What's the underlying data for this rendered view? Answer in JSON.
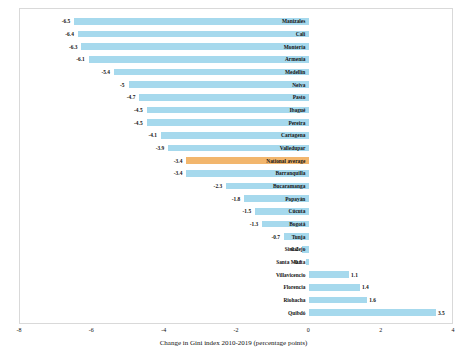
{
  "chart_data": {
    "type": "bar",
    "orientation": "horizontal",
    "title": "",
    "xlabel": "Change in Gini index 2010-2019 (percentage points)",
    "ylabel": "",
    "xlim": [
      -8,
      4
    ],
    "xticks": [
      "-8",
      "-6",
      "-4",
      "-2",
      "0",
      "2",
      "4"
    ],
    "xtick_values": [
      -8,
      -6,
      -4,
      -2,
      0,
      2,
      4
    ],
    "grid": false,
    "legend": "none",
    "colors": {
      "bar": "#a6d9ed",
      "highlight": "#f2b66d",
      "frame": "#d9d9d9",
      "text": "#111111",
      "background": "#ffffff"
    },
    "categories": [
      "Manizales",
      "Cali",
      "Montería",
      "Armenia",
      "Medellín",
      "Neiva",
      "Pasto",
      "Ibagué",
      "Pereira",
      "Cartagena",
      "Valledupar",
      "National average",
      "Barranquilla",
      "Bucaramanga",
      "Popayán",
      "Cúcuta",
      "Bogotá",
      "Tunja",
      "Sincelejo",
      "Santa Marta",
      "Villavicencio",
      "Florencia",
      "Riohacha",
      "Quibdó"
    ],
    "values": [
      -6.5,
      -6.4,
      -6.3,
      -6.1,
      -5.4,
      -5.0,
      -4.7,
      -4.5,
      -4.5,
      -4.1,
      -3.9,
      -3.4,
      -3.4,
      -2.3,
      -1.8,
      -1.5,
      -1.3,
      -0.7,
      -0.2,
      -0.1,
      1.1,
      1.4,
      1.6,
      3.5
    ],
    "value_labels": [
      "-6.5",
      "-6.4",
      "-6.3",
      "-6.1",
      "-5.4",
      "-5",
      "-4.7",
      "-4.5",
      "-4.5",
      "-4.1",
      "-3.9",
      "-3.4",
      "-3.4",
      "-2.3",
      "-1.8",
      "-1.5",
      "-1.3",
      "-0.7",
      "-0.2",
      "-0.1",
      "1.1",
      "1.4",
      "1.6",
      "3.5"
    ],
    "highlight_category": "National average"
  }
}
